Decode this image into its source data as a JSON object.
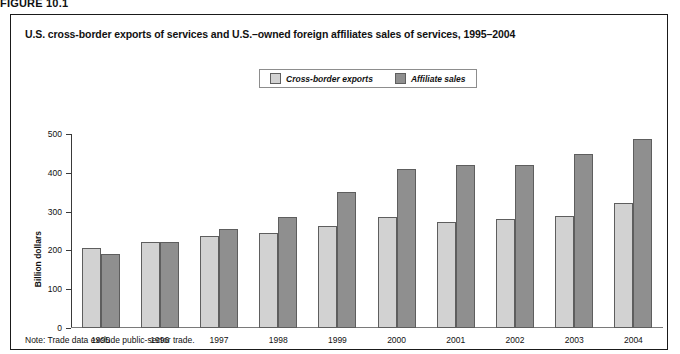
{
  "figure": {
    "label": "FIGURE 10.1",
    "title": "U.S. cross-border exports of services and U.S.–owned foreign affiliates sales of services, 1995–2004",
    "note": "Note: Trade data exclude public-sector trade."
  },
  "colors": {
    "exports_fill": "#d2d2d2",
    "affiliate_fill": "#8f8f8f",
    "bar_stroke": "#5e5e5e",
    "frame": "#1a1a1a",
    "text": "#111111"
  },
  "chart_data": {
    "type": "bar",
    "title": "U.S. cross-border exports of services and U.S.–owned foreign affiliates sales of services, 1995–2004",
    "xlabel": "",
    "ylabel": "Billion dollars",
    "ylim": [
      0,
      500
    ],
    "yticks": [
      0,
      100,
      200,
      300,
      400,
      500
    ],
    "ytick_labels": [
      "0",
      "100",
      "200",
      "300",
      "400",
      "500"
    ],
    "grid": false,
    "legend_position": "top-center",
    "categories": [
      "1995",
      "1996",
      "1997",
      "1998",
      "1999",
      "2000",
      "2001",
      "2002",
      "2003",
      "2004"
    ],
    "series": [
      {
        "name": "Cross-border exports",
        "color": "#d2d2d2",
        "values": [
          205,
          221,
          238,
          244,
          263,
          285,
          272,
          280,
          289,
          322
        ]
      },
      {
        "name": "Affiliate sales",
        "color": "#8f8f8f",
        "values": [
          190,
          221,
          255,
          287,
          351,
          411,
          420,
          419,
          449,
          487
        ]
      }
    ],
    "note": "Note: Trade data exclude public-sector trade."
  }
}
